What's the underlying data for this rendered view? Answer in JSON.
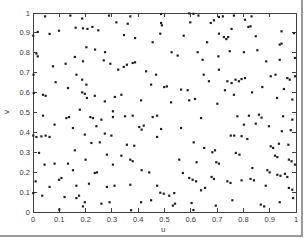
{
  "figure": {
    "background": "#ffffff",
    "frame_color": "#9a9a9a"
  },
  "chart_data": {
    "type": "scatter",
    "title": "",
    "xlabel": "u",
    "ylabel": "v",
    "xlim": [
      0,
      1
    ],
    "ylim": [
      0,
      1
    ],
    "xticks": [
      0,
      0.1,
      0.2,
      0.3,
      0.4,
      0.5,
      0.6,
      0.7,
      0.8,
      0.9,
      1
    ],
    "yticks": [
      0,
      0.1,
      0.2,
      0.3,
      0.4,
      0.5,
      0.6,
      0.7,
      0.8,
      0.9,
      1
    ],
    "xtick_labels": [
      "0",
      "0.1",
      "0.2",
      "0.3",
      "0.4",
      "0.5",
      "0.6",
      "0.7",
      "0.8",
      "0.9",
      "1"
    ],
    "ytick_labels": [
      "0",
      "0.1",
      "0.2",
      "0.3",
      "0.4",
      "0.5",
      "0.6",
      "0.7",
      "0.8",
      "0.9",
      "1"
    ],
    "grid": false,
    "box": true,
    "legend": null,
    "axis_color": "#404040",
    "marker": {
      "shape": "point",
      "color": "#1f1f1f",
      "size_px": 2.2
    },
    "points": [
      [
        0.046,
        0.983
      ],
      [
        0.142,
        0.987
      ],
      [
        0.187,
        0.972
      ],
      [
        0.289,
        0.987
      ],
      [
        0.317,
        0.953
      ],
      [
        0.018,
        0.905
      ],
      [
        0.063,
        0.895
      ],
      [
        0.099,
        0.911
      ],
      [
        0.162,
        0.926
      ],
      [
        0.19,
        0.923
      ],
      [
        0.207,
        0.92
      ],
      [
        0.226,
        0.93
      ],
      [
        0.248,
        0.913
      ],
      [
        0.001,
        0.886
      ],
      [
        0.203,
        0.828
      ],
      [
        0.236,
        0.816
      ],
      [
        0.274,
        0.803
      ],
      [
        0.013,
        0.796
      ],
      [
        0.018,
        0.782
      ],
      [
        0.076,
        0.732
      ],
      [
        0.124,
        0.745
      ],
      [
        0.159,
        0.779
      ],
      [
        0.19,
        0.757
      ],
      [
        0.269,
        0.762
      ],
      [
        0.294,
        0.745
      ],
      [
        0.324,
        0.715
      ],
      [
        0.002,
        0.69
      ],
      [
        0.086,
        0.652
      ],
      [
        0.133,
        0.623
      ],
      [
        0.165,
        0.69
      ],
      [
        0.187,
        0.665
      ],
      [
        0.203,
        0.64
      ],
      [
        0.003,
        0.598
      ],
      [
        0.038,
        0.589
      ],
      [
        0.048,
        0.584
      ],
      [
        0.187,
        0.601
      ],
      [
        0.197,
        0.594
      ],
      [
        0.205,
        0.573
      ],
      [
        0.235,
        0.584
      ],
      [
        0.273,
        0.556
      ],
      [
        0.311,
        0.578
      ],
      [
        0.178,
        0.514
      ],
      [
        0.304,
        0.506
      ],
      [
        0.37,
        0.983
      ],
      [
        0.487,
        0.995
      ],
      [
        0.594,
        0.998
      ],
      [
        0.61,
        0.996
      ],
      [
        0.629,
        0.987
      ],
      [
        0.36,
        0.946
      ],
      [
        0.487,
        0.95
      ],
      [
        0.49,
        0.938
      ],
      [
        0.598,
        0.953
      ],
      [
        0.346,
        0.889
      ],
      [
        0.388,
        0.874
      ],
      [
        0.455,
        0.853
      ],
      [
        0.484,
        0.896
      ],
      [
        0.573,
        0.886
      ],
      [
        0.662,
        0.853
      ],
      [
        0.527,
        0.803
      ],
      [
        0.55,
        0.786
      ],
      [
        0.626,
        0.803
      ],
      [
        0.645,
        0.765
      ],
      [
        0.357,
        0.74
      ],
      [
        0.379,
        0.749
      ],
      [
        0.388,
        0.752
      ],
      [
        0.345,
        0.729
      ],
      [
        0.43,
        0.707
      ],
      [
        0.468,
        0.69
      ],
      [
        0.649,
        0.69
      ],
      [
        0.449,
        0.64
      ],
      [
        0.499,
        0.628
      ],
      [
        0.509,
        0.631
      ],
      [
        0.563,
        0.615
      ],
      [
        0.588,
        0.612
      ],
      [
        0.336,
        0.589
      ],
      [
        0.411,
        0.561
      ],
      [
        0.525,
        0.551
      ],
      [
        0.594,
        0.561
      ],
      [
        0.616,
        0.568
      ],
      [
        0.707,
        0.98
      ],
      [
        0.722,
        0.983
      ],
      [
        0.688,
        0.963
      ],
      [
        0.676,
        0.95
      ],
      [
        0.764,
        0.987
      ],
      [
        0.806,
        0.966
      ],
      [
        0.831,
        0.983
      ],
      [
        0.819,
        0.93
      ],
      [
        0.827,
        0.933
      ],
      [
        0.755,
        0.92
      ],
      [
        0.707,
        0.896
      ],
      [
        0.726,
        0.879
      ],
      [
        0.735,
        0.869
      ],
      [
        0.742,
        0.879
      ],
      [
        0.847,
        0.883
      ],
      [
        0.945,
        0.908
      ],
      [
        0.992,
        0.899
      ],
      [
        0.938,
        0.841
      ],
      [
        0.945,
        0.846
      ],
      [
        0.853,
        0.813
      ],
      [
        0.802,
        0.803
      ],
      [
        0.748,
        0.808
      ],
      [
        0.705,
        0.782
      ],
      [
        0.887,
        0.757
      ],
      [
        0.938,
        0.765
      ],
      [
        0.996,
        0.774
      ],
      [
        0.707,
        0.715
      ],
      [
        0.669,
        0.657
      ],
      [
        0.739,
        0.657
      ],
      [
        0.755,
        0.648
      ],
      [
        0.77,
        0.665
      ],
      [
        0.783,
        0.657
      ],
      [
        0.793,
        0.668
      ],
      [
        0.806,
        0.673
      ],
      [
        0.904,
        0.682
      ],
      [
        0.922,
        0.69
      ],
      [
        0.967,
        0.673
      ],
      [
        0.976,
        0.665
      ],
      [
        0.996,
        0.682
      ],
      [
        0.73,
        0.612
      ],
      [
        0.764,
        0.589
      ],
      [
        0.833,
        0.601
      ],
      [
        0.872,
        0.628
      ],
      [
        0.954,
        0.618
      ],
      [
        0.928,
        0.573
      ],
      [
        0.986,
        0.565
      ],
      [
        0.701,
        0.544
      ],
      [
        0.038,
        0.484
      ],
      [
        0.127,
        0.472
      ],
      [
        0.137,
        0.477
      ],
      [
        0.218,
        0.477
      ],
      [
        0.228,
        0.472
      ],
      [
        0.26,
        0.464
      ],
      [
        0.304,
        0.477
      ],
      [
        0.082,
        0.439
      ],
      [
        0.152,
        0.422
      ],
      [
        0.241,
        0.431
      ],
      [
        0.001,
        0.384
      ],
      [
        0.013,
        0.377
      ],
      [
        0.032,
        0.38
      ],
      [
        0.048,
        0.384
      ],
      [
        0.063,
        0.377
      ],
      [
        0.197,
        0.389
      ],
      [
        0.273,
        0.394
      ],
      [
        0.298,
        0.384
      ],
      [
        0.222,
        0.347
      ],
      [
        0.254,
        0.35
      ],
      [
        0.023,
        0.297
      ],
      [
        0.159,
        0.31
      ],
      [
        0.2,
        0.263
      ],
      [
        0.281,
        0.288
      ],
      [
        0.044,
        0.238
      ],
      [
        0.082,
        0.243
      ],
      [
        0.133,
        0.243
      ],
      [
        0.152,
        0.21
      ],
      [
        0.235,
        0.196
      ],
      [
        0.243,
        0.199
      ],
      [
        0.304,
        0.238
      ],
      [
        0.099,
        0.162
      ],
      [
        0.108,
        0.171
      ],
      [
        0.01,
        0.154
      ],
      [
        0.063,
        0.126
      ],
      [
        0.165,
        0.132
      ],
      [
        0.213,
        0.142
      ],
      [
        0.281,
        0.126
      ],
      [
        0.31,
        0.132
      ],
      [
        0.001,
        0.095
      ],
      [
        0.035,
        0.082
      ],
      [
        0.12,
        0.075
      ],
      [
        0.165,
        0.07
      ],
      [
        0.175,
        0.082
      ],
      [
        0.197,
        0.049
      ],
      [
        0.19,
        0.028
      ],
      [
        0.26,
        0.042
      ],
      [
        0.291,
        0.049
      ],
      [
        0.1,
        0.012
      ],
      [
        0.35,
        0.481
      ],
      [
        0.379,
        0.484
      ],
      [
        0.455,
        0.477
      ],
      [
        0.472,
        0.484
      ],
      [
        0.639,
        0.472
      ],
      [
        0.404,
        0.427
      ],
      [
        0.413,
        0.414
      ],
      [
        0.421,
        0.434
      ],
      [
        0.487,
        0.417
      ],
      [
        0.563,
        0.422
      ],
      [
        0.472,
        0.377
      ],
      [
        0.357,
        0.338
      ],
      [
        0.385,
        0.333
      ],
      [
        0.611,
        0.35
      ],
      [
        0.651,
        0.322
      ],
      [
        0.336,
        0.283
      ],
      [
        0.37,
        0.263
      ],
      [
        0.379,
        0.255
      ],
      [
        0.556,
        0.263
      ],
      [
        0.622,
        0.25
      ],
      [
        0.413,
        0.21
      ],
      [
        0.442,
        0.199
      ],
      [
        0.57,
        0.196
      ],
      [
        0.594,
        0.171
      ],
      [
        0.607,
        0.162
      ],
      [
        0.62,
        0.154
      ],
      [
        0.37,
        0.137
      ],
      [
        0.472,
        0.132
      ],
      [
        0.484,
        0.097
      ],
      [
        0.497,
        0.092
      ],
      [
        0.518,
        0.082
      ],
      [
        0.537,
        0.095
      ],
      [
        0.639,
        0.109
      ],
      [
        0.654,
        0.121
      ],
      [
        0.411,
        0.049
      ],
      [
        0.449,
        0.059
      ],
      [
        0.532,
        0.032
      ],
      [
        0.54,
        0.042
      ],
      [
        0.603,
        0.045
      ],
      [
        0.373,
        0.009
      ],
      [
        0.61,
        0.01
      ],
      [
        0.777,
        0.481
      ],
      [
        0.821,
        0.484
      ],
      [
        0.859,
        0.489
      ],
      [
        0.869,
        0.474
      ],
      [
        0.951,
        0.481
      ],
      [
        0.986,
        0.464
      ],
      [
        0.802,
        0.439
      ],
      [
        0.847,
        0.444
      ],
      [
        0.897,
        0.431
      ],
      [
        0.946,
        0.406
      ],
      [
        0.98,
        0.411
      ],
      [
        0.752,
        0.384
      ],
      [
        0.765,
        0.384
      ],
      [
        0.793,
        0.381
      ],
      [
        0.815,
        0.367
      ],
      [
        0.682,
        0.3
      ],
      [
        0.692,
        0.31
      ],
      [
        0.771,
        0.297
      ],
      [
        0.785,
        0.288
      ],
      [
        0.697,
        0.25
      ],
      [
        0.707,
        0.243
      ],
      [
        0.904,
        0.33
      ],
      [
        0.913,
        0.322
      ],
      [
        0.935,
        0.343
      ],
      [
        0.971,
        0.338
      ],
      [
        0.92,
        0.283
      ],
      [
        0.929,
        0.276
      ],
      [
        0.973,
        0.263
      ],
      [
        0.983,
        0.255
      ],
      [
        0.996,
        0.238
      ],
      [
        0.834,
        0.221
      ],
      [
        0.891,
        0.21
      ],
      [
        0.9,
        0.199
      ],
      [
        0.929,
        0.187
      ],
      [
        0.941,
        0.182
      ],
      [
        0.958,
        0.192
      ],
      [
        0.967,
        0.176
      ],
      [
        0.679,
        0.176
      ],
      [
        0.688,
        0.166
      ],
      [
        0.739,
        0.154
      ],
      [
        0.751,
        0.146
      ],
      [
        0.793,
        0.159
      ],
      [
        0.827,
        0.166
      ],
      [
        0.84,
        0.159
      ],
      [
        0.885,
        0.132
      ],
      [
        0.973,
        0.121
      ],
      [
        0.986,
        0.112
      ],
      [
        0.758,
        0.059
      ],
      [
        0.695,
        0.032
      ],
      [
        0.866,
        0.037
      ],
      [
        0.879,
        0.028
      ],
      [
        0.938,
        0.049
      ],
      [
        0.989,
        0.07
      ]
    ]
  }
}
